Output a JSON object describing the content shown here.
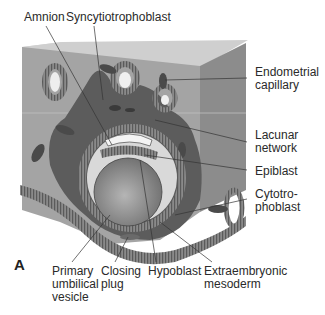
{
  "figure": {
    "panel_label": "A",
    "colors": {
      "tissue_block": "#9a9a9a",
      "block_top": "#c8c8c8",
      "block_side": "#858585",
      "syncytiotrophoblast": "#555555",
      "cavity": "#d8d8d8",
      "leader_lines": "#333333"
    }
  },
  "labels": {
    "amnion": [
      "Amnion"
    ],
    "syncytiotrophoblast": [
      "Syncytiotrophoblast"
    ],
    "endometrial_capillary": [
      "Endometrial",
      "capillary"
    ],
    "lacunar_network": [
      "Lacunar",
      "network"
    ],
    "epiblast": [
      "Epiblast"
    ],
    "cytotrophoblast": [
      "Cytotro-",
      "phoblast"
    ],
    "primary_umbilical_vesicle": [
      "Primary",
      "umbilical",
      "vesicle"
    ],
    "closing_plug": [
      "Closing",
      "plug"
    ],
    "hypoblast": [
      "Hypoblast"
    ],
    "extraembryonic_mesoderm": [
      "Extraembryonic",
      "mesoderm"
    ]
  }
}
